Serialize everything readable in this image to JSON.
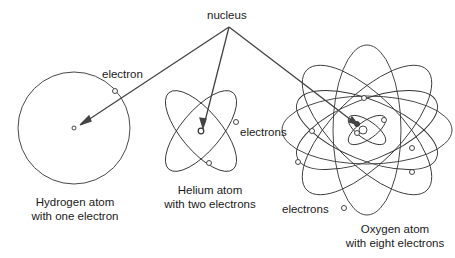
{
  "labels": {
    "nucleus": "nucleus",
    "electron": "electron",
    "electrons_helium": "electrons",
    "electrons_oxygen": "electrons"
  },
  "captions": {
    "hydrogen_line1": "Hydrogen atom",
    "hydrogen_line2": "with one electron",
    "helium_line1": "Helium atom",
    "helium_line2": "with two electrons",
    "oxygen_line1": "Oxygen atom",
    "oxygen_line2": "with eight electrons"
  }
}
